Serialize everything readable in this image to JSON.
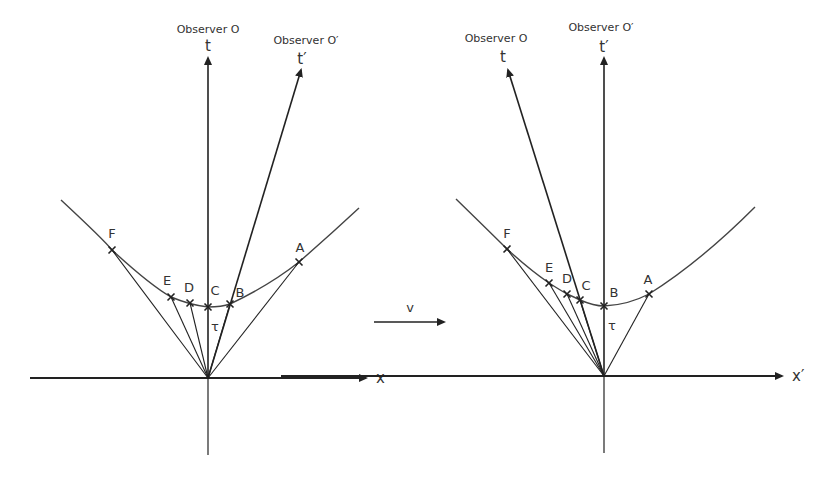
{
  "colors": {
    "line": "#222222",
    "curve": "#444444",
    "text": "#333333",
    "background": "#ffffff"
  },
  "transform": {
    "label": "v",
    "arrow": {
      "x1": 374,
      "y1": 322,
      "x2": 444,
      "y2": 322
    },
    "label_pos": {
      "x": 410,
      "y": 312
    }
  },
  "diagrams": [
    {
      "name": "frame-O",
      "origin": {
        "x": 208,
        "y": 378
      },
      "x_axis": {
        "label": "x",
        "x1": 30,
        "x2": 366,
        "y": 378,
        "label_x": 376,
        "label_y": 383
      },
      "vertical_down_end": 455,
      "t_axis": {
        "label": "t",
        "observer": "Observer O",
        "tip": {
          "x": 208,
          "y": 58
        },
        "label_x": 208,
        "label_y": 51,
        "observer_x": 208,
        "observer_y": 33
      },
      "tprime_axis": {
        "label": "t′",
        "observer": "Observer O′",
        "tip": {
          "x": 301,
          "y": 70
        },
        "label_x": 302,
        "label_y": 64,
        "observer_x": 306,
        "observer_y": 44
      },
      "hyperbola": {
        "path": "M61,200 Q104,240 112,250 Q150,285 171,297 Q190,305 208,307 Q222,307 230,304 Q270,285 299,262 Q330,235 359,208"
      },
      "tau": {
        "label": "τ",
        "x": 215,
        "y": 331
      },
      "events": [
        {
          "label": "F",
          "x": 112,
          "y": 250,
          "lx": 112,
          "ly": 238
        },
        {
          "label": "E",
          "x": 171,
          "y": 297,
          "lx": 167,
          "ly": 285
        },
        {
          "label": "D",
          "x": 190,
          "y": 303,
          "lx": 189,
          "ly": 292
        },
        {
          "label": "C",
          "x": 208,
          "y": 307,
          "lx": 215,
          "ly": 295
        },
        {
          "label": "B",
          "x": 230,
          "y": 304,
          "lx": 240,
          "ly": 297
        },
        {
          "label": "A",
          "x": 299,
          "y": 262,
          "lx": 300,
          "ly": 252
        }
      ]
    },
    {
      "name": "frame-O-prime",
      "origin": {
        "x": 604,
        "y": 376
      },
      "x_axis": {
        "label": "x′",
        "x1": 281,
        "x2": 782,
        "y": 376,
        "label_x": 792,
        "label_y": 381
      },
      "vertical_down_end": 453,
      "t_axis": {
        "label": "t",
        "observer": "Observer O",
        "tip": {
          "x": 508,
          "y": 70
        },
        "label_x": 503,
        "label_y": 62,
        "observer_x": 496,
        "observer_y": 42
      },
      "tprime_axis": {
        "label": "t′",
        "observer": "Observer O′",
        "tip": {
          "x": 604,
          "y": 58
        },
        "label_x": 604,
        "label_y": 52,
        "observer_x": 601,
        "observer_y": 31
      },
      "hyperbola": {
        "path": "M456,199 Q495,237 507,249 Q530,270 549,283 Q560,290 567,294 Q574,297 580,300 Q594,306 604,306 Q628,305 649,294 Q700,262 755,207"
      },
      "tau": {
        "label": "τ",
        "x": 612,
        "y": 330
      },
      "events": [
        {
          "label": "F",
          "x": 507,
          "y": 249,
          "lx": 507,
          "ly": 238
        },
        {
          "label": "E",
          "x": 549,
          "y": 283,
          "lx": 549,
          "ly": 272
        },
        {
          "label": "D",
          "x": 567,
          "y": 294,
          "lx": 567,
          "ly": 283
        },
        {
          "label": "C",
          "x": 580,
          "y": 300,
          "lx": 586,
          "ly": 290
        },
        {
          "label": "B",
          "x": 604,
          "y": 306,
          "lx": 614,
          "ly": 297
        },
        {
          "label": "A",
          "x": 649,
          "y": 294,
          "lx": 648,
          "ly": 284
        }
      ]
    }
  ]
}
